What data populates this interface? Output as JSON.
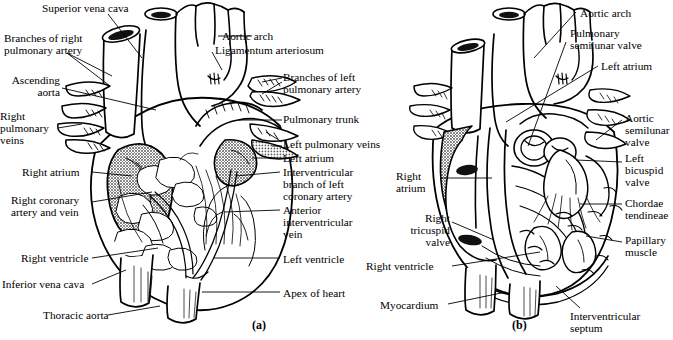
{
  "figure": {
    "panels": [
      {
        "id": "a",
        "caption": "(a)",
        "view": "anterior external view",
        "x": 252,
        "y": 318
      },
      {
        "id": "b",
        "caption": "(b)",
        "view": "frontal section / internal view",
        "x": 512,
        "y": 318
      }
    ]
  },
  "panel_a": {
    "labels": [
      {
        "name": "superior-vena-cava",
        "text": "Superior vena cava",
        "x": 42,
        "y": 2,
        "align": "left"
      },
      {
        "name": "branches-of-right-pulmonary-artery",
        "text": "Branches of right\npulmonary artery",
        "x": 4,
        "y": 32,
        "align": "left"
      },
      {
        "name": "ascending-aorta",
        "text": "Ascending\naorta",
        "x": 0,
        "y": 74,
        "align": "right",
        "w": 60
      },
      {
        "name": "right-pulmonary-veins",
        "text": "Right\npulmonary\nveins",
        "x": 0,
        "y": 110,
        "align": "left"
      },
      {
        "name": "right-atrium",
        "text": "Right atrium",
        "x": 22,
        "y": 166,
        "align": "left"
      },
      {
        "name": "right-coronary-artery-and-vein",
        "text": "Right coronary\nartery and vein",
        "x": 11,
        "y": 194,
        "align": "left"
      },
      {
        "name": "right-ventricle",
        "text": "Right ventricle",
        "x": 21,
        "y": 252,
        "align": "left"
      },
      {
        "name": "inferior-vena-cava",
        "text": "Inferior vena cava",
        "x": 2,
        "y": 278,
        "align": "left"
      },
      {
        "name": "thoracic-aorta",
        "text": "Thoracic aorta",
        "x": 43,
        "y": 309,
        "align": "left"
      },
      {
        "name": "aortic-arch",
        "text": "Aortic arch",
        "x": 222,
        "y": 30,
        "align": "left"
      },
      {
        "name": "ligamentum-arteriosum",
        "text": "Ligamentum arteriosum",
        "x": 215,
        "y": 44,
        "align": "left"
      },
      {
        "name": "branches-of-left-pulmonary-artery",
        "text": "Branches of left\npulmonary artery",
        "x": 283,
        "y": 71,
        "align": "left"
      },
      {
        "name": "pulmonary-trunk",
        "text": "Pulmonary trunk",
        "x": 283,
        "y": 113,
        "align": "left"
      },
      {
        "name": "left-pulmonary-veins",
        "text": "Left pulmonary veins",
        "x": 283,
        "y": 138,
        "align": "left"
      },
      {
        "name": "left-atrium",
        "text": "Left atrium",
        "x": 283,
        "y": 152,
        "align": "left"
      },
      {
        "name": "interventricular-branch-of-left-coronary-artery",
        "text": "Interventricular\nbranch of left\ncoronary artery",
        "x": 283,
        "y": 166,
        "align": "left"
      },
      {
        "name": "anterior-interventricular-vein",
        "text": "Anterior\ninterventricular\nvein",
        "x": 283,
        "y": 204,
        "align": "left"
      },
      {
        "name": "left-ventricle",
        "text": "Left ventricle",
        "x": 283,
        "y": 253,
        "align": "left"
      },
      {
        "name": "apex-of-heart",
        "text": "Apex of heart",
        "x": 283,
        "y": 287,
        "align": "left"
      }
    ]
  },
  "panel_b": {
    "labels": [
      {
        "name": "aortic-arch-b",
        "text": "Aortic arch",
        "x": 580,
        "y": 7,
        "align": "left"
      },
      {
        "name": "pulmonary-semilunar-valve",
        "text": "Pulmonary\nsemilunar valve",
        "x": 570,
        "y": 27,
        "align": "left"
      },
      {
        "name": "left-atrium-b",
        "text": "Left atrium",
        "x": 601,
        "y": 60,
        "align": "left"
      },
      {
        "name": "aortic-semilunar-valve",
        "text": "Aortic\nsemilunar\nvalve",
        "x": 625,
        "y": 112,
        "align": "left"
      },
      {
        "name": "left-bicuspid-valve",
        "text": "Left\nbicuspid\nvalve",
        "x": 625,
        "y": 152,
        "align": "left"
      },
      {
        "name": "chordae-tendineae",
        "text": "Chordae\ntendineae",
        "x": 625,
        "y": 197,
        "align": "left"
      },
      {
        "name": "papillary-muscle",
        "text": "Papillary\nmuscle",
        "x": 625,
        "y": 234,
        "align": "left"
      },
      {
        "name": "interventricular-septum",
        "text": "Interventricular\nseptum",
        "x": 570,
        "y": 310,
        "align": "left"
      },
      {
        "name": "right-atrium-b",
        "text": "Right\natrium",
        "x": 396,
        "y": 170,
        "align": "left"
      },
      {
        "name": "right-tricuspid-valve",
        "text": "Right\ntricuspid\nvalve",
        "x": 368,
        "y": 212,
        "align": "right",
        "w": 82
      },
      {
        "name": "right-ventricle-b",
        "text": "Right ventricle",
        "x": 366,
        "y": 260,
        "align": "left"
      },
      {
        "name": "myocardium",
        "text": "Myocardium",
        "x": 380,
        "y": 299,
        "align": "left"
      }
    ]
  },
  "style": {
    "ink": "#000000",
    "paper": "#ffffff",
    "shading_gray": "#8a8a8a",
    "stipple": "halftone-dot"
  }
}
